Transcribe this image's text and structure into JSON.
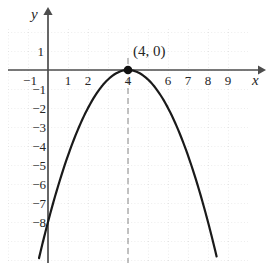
{
  "figure": {
    "kind": "cartesian-graph",
    "background": "#ffffff",
    "curve_color": "#1a1a1a",
    "axis_color": "#4d4d4d",
    "grid_color": "#d9d9d9",
    "dash_color": "#999999",
    "point_color": "#111111"
  },
  "axes": {
    "x_name": "x",
    "y_name": "y",
    "x_ticks": [
      {
        "value": -1,
        "label": "−1"
      },
      {
        "value": 1,
        "label": "1"
      },
      {
        "value": 2,
        "label": "2"
      },
      {
        "value": 4,
        "label": "4"
      },
      {
        "value": 6,
        "label": "6"
      },
      {
        "value": 7,
        "label": "7"
      },
      {
        "value": 8,
        "label": "8"
      },
      {
        "value": 9,
        "label": "9"
      }
    ],
    "y_ticks": [
      {
        "value": 1,
        "label": "1"
      },
      {
        "value": -1,
        "label": "−1"
      },
      {
        "value": -2,
        "label": "−2"
      },
      {
        "value": -3,
        "label": "−3"
      },
      {
        "value": -4,
        "label": "−4"
      },
      {
        "value": -5,
        "label": "−5"
      },
      {
        "value": -6,
        "label": "−6"
      },
      {
        "value": -7,
        "label": "−7"
      },
      {
        "value": -8,
        "label": "−8"
      }
    ]
  },
  "annotations": {
    "vertex_label": "(4, 0)"
  },
  "chart_data": {
    "type": "line",
    "title": "",
    "xlabel": "x",
    "ylabel": "y",
    "grid": true,
    "legend": "none",
    "xlim": [
      -2,
      10.5
    ],
    "ylim": [
      -10.5,
      1.8
    ],
    "x_ticks": [
      -1,
      1,
      2,
      4,
      6,
      7,
      8,
      9
    ],
    "y_ticks": [
      1,
      -1,
      -2,
      -3,
      -4,
      -5,
      -6,
      -7,
      -8
    ],
    "series": [
      {
        "name": "parabola",
        "equation": "y = -0.5(x - 4)^2",
        "vertex": [
          4,
          0
        ],
        "opens": "down",
        "x": [
          -0.4,
          0,
          0.5,
          1,
          1.5,
          2,
          2.5,
          3,
          3.5,
          4,
          4.5,
          5,
          5.5,
          6,
          6.5,
          7,
          7.5,
          8,
          8.4
        ],
        "values": [
          -9.68,
          -8,
          -6.125,
          -4.5,
          -3.125,
          -2,
          -1.125,
          -0.5,
          -0.125,
          0,
          -0.125,
          -0.5,
          -1.125,
          -2,
          -3.125,
          -4.5,
          -6.125,
          -8,
          -9.68
        ]
      }
    ],
    "points": [
      {
        "label": "(4, 0)",
        "x": 4,
        "y": 0,
        "marker": "filled-circle"
      }
    ],
    "guides": [
      {
        "type": "vertical-dashed",
        "x": 4,
        "from_y": -10.5,
        "to_y": 0.6
      }
    ]
  }
}
